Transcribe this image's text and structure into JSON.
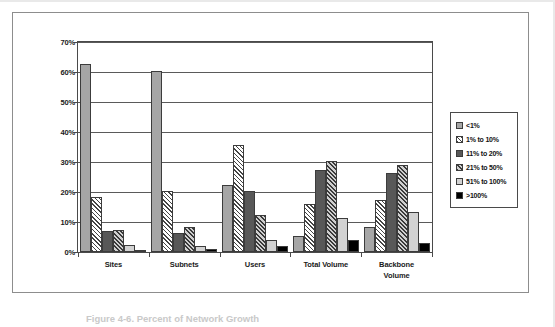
{
  "figure": {
    "caption": "Figure 4-6.  Percent of Network Growth"
  },
  "chart_data": {
    "type": "bar",
    "title": "",
    "xlabel": "",
    "ylabel": "",
    "ylim": [
      0,
      70
    ],
    "ytick_step": 10,
    "ytick_labels": [
      "0%",
      "10%",
      "20%",
      "30%",
      "40%",
      "50%",
      "60%",
      "70%"
    ],
    "grid": true,
    "legend_position": "right",
    "categories": [
      "Sites",
      "Subnets",
      "Users",
      "Total Volume",
      "Backbone Volume"
    ],
    "category_label_lines": [
      [
        "Sites"
      ],
      [
        "Subnets"
      ],
      [
        "Users"
      ],
      [
        "Total Volume"
      ],
      [
        "Backbone",
        "Volume"
      ]
    ],
    "series": [
      {
        "name": "<1%",
        "pattern": "solid-medium-gray",
        "color": "#a6a6a6",
        "values": [
          63,
          60.5,
          22.5,
          5.5,
          8.5
        ]
      },
      {
        "name": "1% to 10%",
        "pattern": "diagonal-hatch-light",
        "color": "#ffffff",
        "values": [
          18.5,
          20.5,
          36,
          16,
          17.5
        ]
      },
      {
        "name": "11% to 20%",
        "pattern": "solid-dark-gray",
        "color": "#585858",
        "values": [
          7,
          6.5,
          20.5,
          27.5,
          26.5
        ]
      },
      {
        "name": "21% to 50%",
        "pattern": "diagonal-hatch-dark",
        "color": "#cfcfcf",
        "values": [
          7.5,
          8.5,
          12.5,
          30.5,
          29
        ]
      },
      {
        "name": "51% to 100%",
        "pattern": "solid-light-gray",
        "color": "#d2d2d2",
        "values": [
          2.5,
          2,
          4,
          11.5,
          13.5
        ]
      },
      {
        "name": ">100%",
        "pattern": "solid-black",
        "color": "#000000",
        "values": [
          0.5,
          1,
          2,
          4,
          3
        ]
      }
    ]
  }
}
